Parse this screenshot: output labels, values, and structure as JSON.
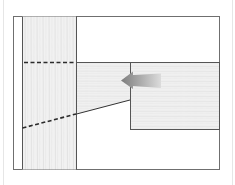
{
  "diagram": {
    "title": "",
    "colors": {
      "frame": "#6f6f6f",
      "wood_fill": "#efefef",
      "wood_grain": "#e2e2e2",
      "dashed": "#2b2b2b",
      "arrow_dark": "#8a8a8a",
      "arrow_light": "#d6d6d6",
      "page_edge": "#e6e6e6"
    },
    "elements": {
      "post": "vertical-post",
      "beam": "horizontal-beam",
      "tenon": "tapered-tenon",
      "arrow": "left-arrow"
    }
  }
}
